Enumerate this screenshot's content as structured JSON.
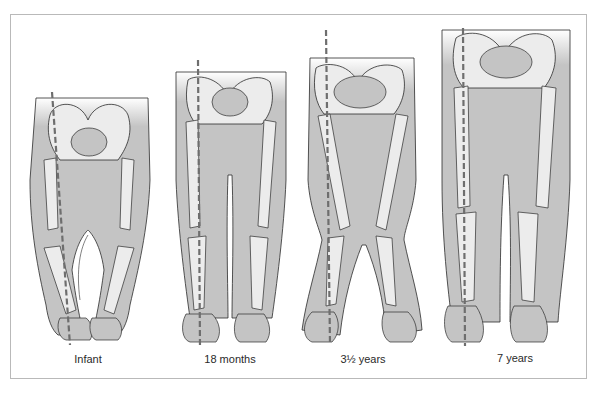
{
  "figure": {
    "stages": [
      {
        "label": "Infant",
        "alignment": "bow-legged (genu varum)",
        "label_x": 38
      },
      {
        "label": "18 months",
        "alignment": "straight",
        "label_x": 180
      },
      {
        "label": "3½ years",
        "alignment": "knock-kneed (genu valgum)",
        "label_x": 313
      },
      {
        "label": "7 years",
        "alignment": "straight",
        "label_x": 465
      }
    ]
  },
  "colors": {
    "skin": "#c4c4c4",
    "bone": "#ececec",
    "outline": "#2b2b2b",
    "dash_line": "#6e6e6e",
    "frame_border": "#b9b9b9"
  }
}
